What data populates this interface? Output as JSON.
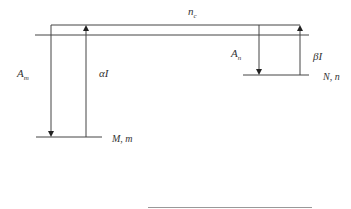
{
  "diagram": {
    "type": "energy-level-transition-diagram",
    "labels": {
      "top_level": "n",
      "top_level_sub": "c",
      "left_decay": "A",
      "left_decay_sub": "m",
      "left_excitation": "αI",
      "right_decay": "A",
      "right_decay_sub": "n",
      "right_excitation": "βI",
      "left_level": "M, m",
      "right_level": "N, n"
    },
    "colors": {
      "line": "#333333",
      "text": "#333333",
      "bottom_rule": "#999999"
    }
  }
}
